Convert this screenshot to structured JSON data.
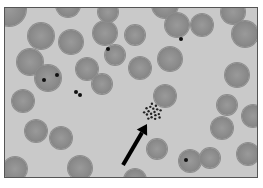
{
  "image": {
    "description": "grayscale micrograph of blood smear with red blood cells; some contain dark inclusion dots; black arrow points to a cluster of fine granules",
    "colors": {
      "background": "#c9c9c9",
      "cell": "#8a8a8a",
      "inclusion": "#111111",
      "arrow": "#000000",
      "border": "#555555"
    }
  },
  "cells": [
    {
      "x": 4,
      "y": 1,
      "r": 17
    },
    {
      "x": 36,
      "y": 28,
      "r": 13
    },
    {
      "x": 63,
      "y": -3,
      "r": 12
    },
    {
      "x": 66,
      "y": 34,
      "r": 12
    },
    {
      "x": 25,
      "y": 54,
      "r": 13
    },
    {
      "x": 43,
      "y": 70,
      "r": 13
    },
    {
      "x": 82,
      "y": 61,
      "r": 11
    },
    {
      "x": 100,
      "y": 25,
      "r": 12
    },
    {
      "x": 110,
      "y": 47,
      "r": 10
    },
    {
      "x": 130,
      "y": 27,
      "r": 10
    },
    {
      "x": 160,
      "y": -3,
      "r": 13
    },
    {
      "x": 172,
      "y": 17,
      "r": 12
    },
    {
      "x": 135,
      "y": 60,
      "r": 11
    },
    {
      "x": 165,
      "y": 51,
      "r": 12
    },
    {
      "x": 197,
      "y": 17,
      "r": 11
    },
    {
      "x": 228,
      "y": 4,
      "r": 12
    },
    {
      "x": 240,
      "y": 26,
      "r": 13
    },
    {
      "x": 232,
      "y": 67,
      "r": 12
    },
    {
      "x": 222,
      "y": 97,
      "r": 10
    },
    {
      "x": 248,
      "y": 108,
      "r": 11
    },
    {
      "x": 97,
      "y": 76,
      "r": 10
    },
    {
      "x": 160,
      "y": 88,
      "r": 11
    },
    {
      "x": 31,
      "y": 123,
      "r": 11
    },
    {
      "x": 56,
      "y": 130,
      "r": 11
    },
    {
      "x": 75,
      "y": 160,
      "r": 12
    },
    {
      "x": 10,
      "y": 161,
      "r": 12
    },
    {
      "x": 130,
      "y": 172,
      "r": 11
    },
    {
      "x": 152,
      "y": 141,
      "r": 10
    },
    {
      "x": 185,
      "y": 153,
      "r": 11
    },
    {
      "x": 205,
      "y": 150,
      "r": 10
    },
    {
      "x": 217,
      "y": 120,
      "r": 11
    },
    {
      "x": 243,
      "y": 146,
      "r": 11
    },
    {
      "x": 103,
      "y": 4,
      "r": 10
    },
    {
      "x": 18,
      "y": 93,
      "r": 11
    }
  ],
  "inclusions": [
    {
      "x": 39,
      "y": 72
    },
    {
      "x": 52,
      "y": 67
    },
    {
      "x": 71,
      "y": 84
    },
    {
      "x": 75,
      "y": 87
    },
    {
      "x": 103,
      "y": 41
    },
    {
      "x": 176,
      "y": 31
    },
    {
      "x": 181,
      "y": 152
    }
  ],
  "arrow": {
    "tail_x": 118,
    "tail_y": 157,
    "head_x": 142,
    "head_y": 116
  },
  "granule_cluster": {
    "x": 148,
    "y": 104,
    "r": 9
  }
}
